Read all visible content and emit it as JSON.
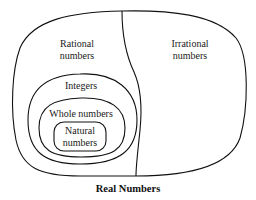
{
  "diagram": {
    "title": "Real Numbers",
    "sets": {
      "rational": {
        "line1": "Rational",
        "line2": "numbers"
      },
      "irrational": {
        "line1": "Irrational",
        "line2": "numbers"
      },
      "integers": {
        "label": "Integers"
      },
      "whole": {
        "label": "Whole numbers"
      },
      "natural": {
        "line1": "Natural",
        "line2": "numbers"
      }
    },
    "colors": {
      "stroke": "#111111",
      "background": "#ffffff",
      "text": "#1a1a1a"
    }
  }
}
